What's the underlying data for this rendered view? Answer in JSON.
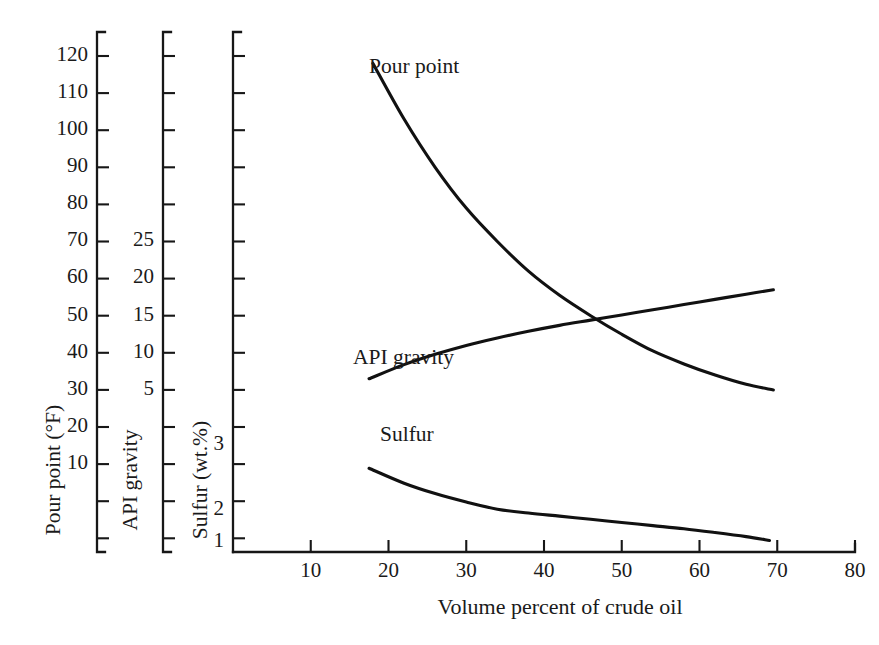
{
  "chart_data": {
    "type": "line",
    "title": "",
    "xlabel": "Volume percent of crude oil",
    "grid": false,
    "legend_position": "inline-labels",
    "xaxis": {
      "label": "Volume percent of crude oil",
      "ticks": [
        10,
        20,
        30,
        40,
        50,
        60,
        70,
        80
      ],
      "tick_labels": [
        "10",
        "20",
        "30",
        "40",
        "50",
        "60",
        "70",
        "80"
      ],
      "range": [
        0,
        80
      ]
    },
    "yaxes": [
      {
        "id": "pour-point",
        "label": "Pour point (°F)",
        "unit": "°F",
        "tick_labels": [
          "120",
          "110",
          "100",
          "90",
          "80",
          "70",
          "60",
          "50",
          "40",
          "30",
          "20",
          "10",
          "",
          "",
          "",
          ""
        ],
        "labeled_ticks": [
          120,
          110,
          100,
          90,
          80,
          70,
          60,
          50,
          40,
          30,
          20,
          10
        ],
        "range": [
          -30,
          130
        ]
      },
      {
        "id": "api-gravity",
        "label": "API gravity",
        "unit": "",
        "tick_labels": [
          "",
          "",
          "",
          "",
          "",
          "",
          "25",
          "20",
          "15",
          "10",
          "5",
          "",
          "",
          "",
          "",
          ""
        ],
        "labeled_ticks": [
          25,
          20,
          15,
          10,
          5
        ],
        "range": [
          -25,
          55
        ]
      },
      {
        "id": "sulfur",
        "label": "Sulfur (wt.%)",
        "unit": "wt.%",
        "tick_labels": [
          "",
          "",
          "",
          "",
          "",
          "",
          "",
          "",
          "",
          "",
          "",
          "3",
          "",
          "2",
          "1"
        ],
        "labeled_ticks": [
          3,
          2,
          1
        ],
        "range": [
          0.5,
          8
        ]
      }
    ],
    "series": [
      {
        "name": "Pour point",
        "label": "Pour point",
        "axis": "pour-point",
        "color": "#111111",
        "x": [
          18,
          22,
          26,
          30,
          34,
          38,
          42,
          46,
          50,
          54,
          58,
          62,
          66,
          69.5
        ],
        "values": [
          118,
          103,
          90,
          79,
          70,
          62,
          55.5,
          50,
          45,
          40.5,
          37,
          34,
          31.5,
          30
        ]
      },
      {
        "name": "API gravity",
        "label": "API gravity",
        "axis": "api-gravity",
        "color": "#111111",
        "x": [
          17.5,
          22,
          26,
          30,
          34,
          38,
          42,
          46,
          50,
          54,
          58,
          62,
          66,
          69.5
        ],
        "values": [
          6.5,
          8.4,
          9.8,
          11.0,
          12.0,
          12.9,
          13.7,
          14.4,
          15.1,
          15.8,
          16.5,
          17.2,
          17.9,
          18.5
        ]
      },
      {
        "name": "Sulfur",
        "label": "Sulfur",
        "axis": "sulfur",
        "color": "#111111",
        "x": [
          17.5,
          22,
          26,
          30,
          34,
          38,
          42,
          46,
          50,
          54,
          58,
          62,
          66,
          69
        ],
        "values": [
          2.65,
          2.42,
          2.26,
          2.13,
          2.02,
          1.92,
          1.82,
          1.72,
          1.62,
          1.52,
          1.42,
          1.3,
          1.17,
          1.05
        ]
      }
    ]
  },
  "axis_titles": {
    "pour_point": "Pour point (°F)",
    "api_gravity": "API gravity",
    "sulfur": "Sulfur (wt.%)",
    "x": "Volume percent of crude oil"
  },
  "series_labels": {
    "pour_point": "Pour point",
    "api_gravity": "API gravity",
    "sulfur": "Sulfur"
  },
  "pour_point_ticks": [
    "120",
    "110",
    "100",
    "90",
    "80",
    "70",
    "60",
    "50",
    "40",
    "30",
    "20",
    "10"
  ],
  "api_gravity_ticks": [
    "25",
    "20",
    "15",
    "10",
    "5"
  ],
  "sulfur_ticks": [
    "3",
    "2",
    "1"
  ],
  "x_ticks": [
    "10",
    "20",
    "30",
    "40",
    "50",
    "60",
    "70",
    "80"
  ],
  "colors": {
    "ink": "#111111",
    "background": "#ffffff"
  }
}
